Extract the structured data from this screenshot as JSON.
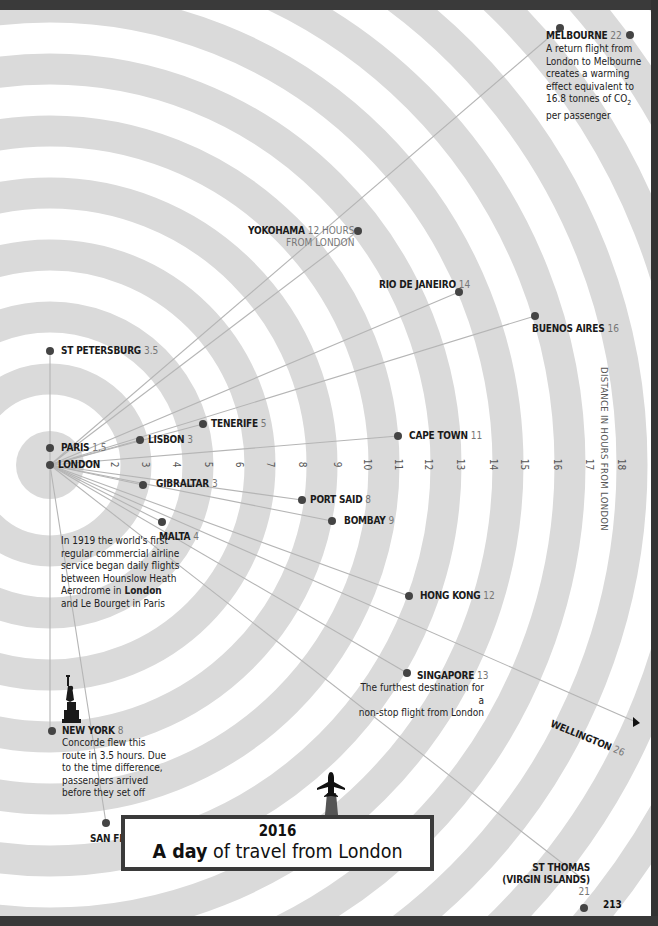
{
  "title": {
    "year": "2016",
    "bold": "A day",
    "rest": " of travel from London"
  },
  "page_number": "213",
  "axis": {
    "title": "DISTANCE IN HOURS FROM LONDON",
    "ticks": [
      "2",
      "3",
      "4",
      "5",
      "6",
      "7",
      "8",
      "9",
      "10",
      "11",
      "12",
      "13",
      "14",
      "15",
      "16",
      "17",
      "18"
    ]
  },
  "origin": {
    "name": "LONDON"
  },
  "cities": [
    {
      "name": "PARIS",
      "hours": "1.5"
    },
    {
      "name": "ST PETERSBURG",
      "hours": "3.5"
    },
    {
      "name": "LISBON",
      "hours": "3"
    },
    {
      "name": "TENERIFE",
      "hours": "5"
    },
    {
      "name": "GIBRALTAR",
      "hours": "3"
    },
    {
      "name": "MALTA",
      "hours": "4"
    },
    {
      "name": "PORT SAID",
      "hours": "8"
    },
    {
      "name": "BOMBAY",
      "hours": "9"
    },
    {
      "name": "CAPE TOWN",
      "hours": "11"
    },
    {
      "name": "HONG KONG",
      "hours": "12"
    },
    {
      "name": "SINGAPORE",
      "hours": "13"
    },
    {
      "name": "NEW YORK",
      "hours": "8"
    },
    {
      "name": "SAN FRANCISCO",
      "hours": "11"
    },
    {
      "name": "YOKOHAMA",
      "hours": "12 HOURS",
      "hours_line2": "FROM LONDON"
    },
    {
      "name": "RIO DE JANEIRO",
      "hours": "14"
    },
    {
      "name": "BUENOS AIRES",
      "hours": "16"
    },
    {
      "name": "MELBOURNE",
      "hours": "22"
    },
    {
      "name": "WELLINGTON",
      "hours": "26"
    },
    {
      "name": "ST THOMAS",
      "name_line2": "(VIRGIN ISLANDS)",
      "hours": "21"
    }
  ],
  "notes": {
    "melbourne": [
      "A return flight from",
      "London to Melbourne",
      "creates a warming",
      "effect equivalent to",
      "16.8 tonnes of CO",
      "2",
      "per passenger"
    ],
    "london_1919": {
      "before": "In 1919 the world's first regular commercial airline service began daily flights between Hounslow Heath Aerodrome in ",
      "bold": "London",
      "after": " and Le Bourget in Paris"
    },
    "singapore": [
      "The furthest destination for a",
      "non-stop flight from London"
    ],
    "new_york": [
      "Concorde flew this",
      "route in 3.5 hours. Due",
      "to the time difference,",
      "passengers arrived",
      "before they set off"
    ]
  },
  "icons": [
    "statue-of-liberty-icon",
    "airplane-icon",
    "arrow-right-icon"
  ],
  "colors": {
    "ring": "#d9d9d9",
    "line": "#b8b8b8",
    "dot": "#444444",
    "frame": "#333333",
    "text": "#1a1a1a",
    "hours": "#777777"
  }
}
